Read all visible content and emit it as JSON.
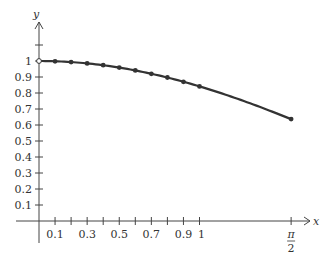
{
  "chart_data": {
    "type": "line",
    "title": "",
    "xlabel": "x",
    "ylabel": "y",
    "x": [
      0,
      0.1,
      0.2,
      0.3,
      0.4,
      0.5,
      0.6,
      0.7,
      0.8,
      0.9,
      1.0,
      1.5708
    ],
    "values": [
      1.0,
      0.998,
      0.993,
      0.985,
      0.974,
      0.959,
      0.941,
      0.92,
      0.897,
      0.87,
      0.841,
      0.637
    ],
    "open_point": {
      "x": 0,
      "y": 1
    },
    "xlim": [
      0,
      1.6
    ],
    "ylim": [
      0,
      1.1
    ],
    "x_ticks": [
      0.1,
      0.2,
      0.3,
      0.4,
      0.5,
      0.6,
      0.7,
      0.8,
      0.9,
      1.0,
      1.5708
    ],
    "x_tick_labels": [
      "0.1",
      "0.3",
      "0.5",
      "0.7",
      "0.9",
      "1"
    ],
    "x_tick_label_values": [
      0.1,
      0.3,
      0.5,
      0.7,
      0.9,
      1.0
    ],
    "pi_half_label": {
      "num": "π",
      "den": "2"
    },
    "y_ticks": [
      0.1,
      0.2,
      0.3,
      0.4,
      0.5,
      0.6,
      0.7,
      0.8,
      0.9,
      1.0,
      1.1
    ],
    "y_tick_labels": [
      "0.1",
      "0.2",
      "0.3",
      "0.4",
      "0.5",
      "0.6",
      "0.7",
      "0.8",
      "0.9",
      "1"
    ],
    "grid": false,
    "legend": null,
    "colors": {
      "line": "#333333",
      "axis": "#444444"
    }
  }
}
